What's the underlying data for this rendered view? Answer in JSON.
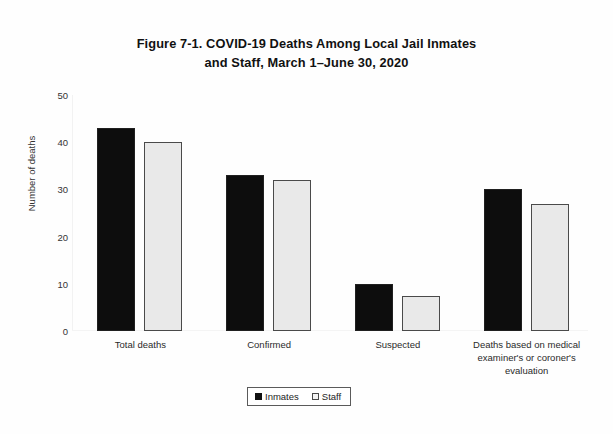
{
  "chart_data": {
    "type": "bar",
    "title": "Figure 7-1. COVID-19 Deaths Among Local Jail Inmates and Staff, March 1–June 30, 2020",
    "title_lines": [
      "Figure 7-1. COVID-19 Deaths Among Local Jail Inmates",
      "and Staff, March 1–June 30, 2020"
    ],
    "xlabel": "",
    "ylabel": "Number of deaths",
    "ylim": [
      0,
      50
    ],
    "ytick_step": 10,
    "ytick_labels": [
      "50",
      "40",
      "30",
      "20",
      "10",
      "0"
    ],
    "ytick_values": [
      50,
      40,
      30,
      20,
      10,
      0
    ],
    "grid": false,
    "legend_position": "bottom-center",
    "categories": [
      "Total deaths",
      "Confirmed",
      "Suspected",
      "Deaths based on medical examiner's or coroner's evaluation"
    ],
    "category_label_lines": [
      [
        "Total deaths"
      ],
      [
        "Confirmed"
      ],
      [
        "Suspected"
      ],
      [
        "Deaths based on medical",
        "examiner's or coroner's",
        "evaluation"
      ]
    ],
    "series": [
      {
        "name": "Inmates",
        "color": "#0d0d0d",
        "values": [
          43,
          33,
          10,
          30
        ]
      },
      {
        "name": "Staff",
        "color": "#e9e9e9",
        "values": [
          40,
          32,
          7.5,
          27
        ]
      }
    ]
  }
}
